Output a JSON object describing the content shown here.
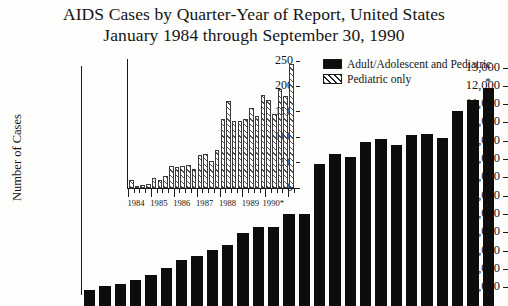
{
  "title": {
    "line1": "AIDS Cases by Quarter-Year of Report, United States",
    "line2": "January 1984 through September 30, 1990"
  },
  "axis": {
    "ylabel": "Number of Cases"
  },
  "legend": {
    "items": [
      {
        "label": "Adult/Adolescent and Pediatric",
        "pattern": "solid",
        "color": "#0d0d0d"
      },
      {
        "label": "Pediatric only",
        "pattern": "hatch",
        "color": "#ffffff"
      }
    ]
  },
  "annotations": {
    "asterisk": "*"
  },
  "chart_data": [
    {
      "id": "main",
      "type": "bar",
      "title": "AIDS Cases by Quarter-Year of Report, United States",
      "subtitle": "January 1984 through September 30, 1990",
      "xlabel": "",
      "ylabel": "Number of Cases",
      "ylim": [
        0,
        13000
      ],
      "ytick_labels": [
        "13,000",
        "12,000",
        "11,000",
        "10,000",
        "9,000",
        "8,000",
        "7,000",
        "6,000",
        "5,000",
        "4,000",
        "3,000",
        "2,000",
        "1,000"
      ],
      "ytick_values": [
        13000,
        12000,
        11000,
        10000,
        9000,
        8000,
        7000,
        6000,
        5000,
        4000,
        3000,
        2000,
        1000
      ],
      "grid": false,
      "legend_position": "top-right",
      "series_name": "Adult/Adolescent and Pediatric",
      "categories": [
        "1984 Q1",
        "1984 Q2",
        "1984 Q3",
        "1984 Q4",
        "1985 Q1",
        "1985 Q2",
        "1985 Q3",
        "1985 Q4",
        "1986 Q1",
        "1986 Q2",
        "1986 Q3",
        "1986 Q4",
        "1987 Q1",
        "1987 Q2",
        "1987 Q3",
        "1987 Q4",
        "1988 Q1",
        "1988 Q2",
        "1988 Q3",
        "1988 Q4",
        "1989 Q1",
        "1989 Q2",
        "1989 Q3",
        "1989 Q4",
        "1990 Q1",
        "1990 Q2",
        "1990 Q3"
      ],
      "values": [
        900,
        1100,
        1200,
        1450,
        1700,
        2100,
        2500,
        2750,
        3050,
        3350,
        4000,
        4350,
        4350,
        5050,
        5050,
        7750,
        8300,
        8150,
        8950,
        9100,
        8800,
        9350,
        9400,
        9200,
        10650,
        11250,
        11900
      ],
      "note": "last bar marked with asterisk (partial quarter, through September 30, 1990)"
    },
    {
      "id": "inset",
      "type": "bar",
      "title": "",
      "xlabel": "",
      "ylabel": "",
      "ylim": [
        0,
        250
      ],
      "ytick_labels": [
        "250",
        "200",
        "150",
        "100",
        "50",
        "0"
      ],
      "ytick_values": [
        250,
        200,
        150,
        100,
        50,
        0
      ],
      "xtick_labels": [
        "1984",
        "1985",
        "1986",
        "1987",
        "1988",
        "1989",
        "1990*"
      ],
      "grid": false,
      "series_name": "Pediatric only",
      "categories": [
        "1984 Q1",
        "1984 Q2",
        "1984 Q3",
        "1984 Q4",
        "1985 Q1",
        "1985 Q2",
        "1985 Q3",
        "1985 Q4",
        "1986 Q1",
        "1986 Q2",
        "1986 Q3",
        "1986 Q4",
        "1987 Q1",
        "1987 Q2",
        "1987 Q3",
        "1987 Q4",
        "1988 Q1",
        "1988 Q2",
        "1988 Q3",
        "1988 Q4",
        "1989 Q1",
        "1989 Q2",
        "1989 Q3",
        "1989 Q4",
        "1990 Q1",
        "1990 Q2",
        "1990 Q3"
      ],
      "values": [
        16,
        4,
        6,
        8,
        20,
        15,
        24,
        44,
        41,
        44,
        45,
        38,
        64,
        66,
        53,
        74,
        136,
        172,
        131,
        132,
        135,
        157,
        141,
        183,
        174,
        146,
        195,
        182,
        245
      ]
    }
  ]
}
